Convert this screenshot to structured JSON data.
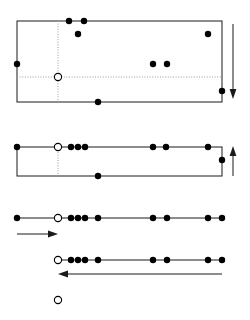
{
  "figure": {
    "title": "",
    "canvas": {
      "width": 250,
      "height": 320,
      "background": "#ffffff"
    },
    "colors": {
      "stroke": "#1a1a1a",
      "guide": "#9a9a9a",
      "marker_filled": "#000000",
      "marker_open_fill": "#ffffff",
      "marker_open_stroke": "#000000"
    },
    "geometry": {
      "left_x": 17,
      "right_x": 222,
      "origin_x": 58,
      "marker_radius_filled": 3.2,
      "marker_radius_open": 3.6,
      "stroke_width": 1
    }
  },
  "panels": [
    {
      "name": "panel-1",
      "type": "rectangle",
      "rect": {
        "x": 17,
        "y": 21,
        "width": 205,
        "height": 81
      },
      "guides": [
        {
          "name": "vertical-guide",
          "orientation": "vertical",
          "x": 58,
          "y1": 21,
          "y2": 102
        },
        {
          "name": "horizontal-guide",
          "orientation": "horizontal",
          "y": 77,
          "x1": 17,
          "x2": 222
        }
      ],
      "origin_marker": {
        "x": 58,
        "y": 77,
        "style": "open"
      },
      "markers": [
        {
          "x": 69,
          "y": 21,
          "style": "filled"
        },
        {
          "x": 84,
          "y": 21,
          "style": "filled"
        },
        {
          "x": 78,
          "y": 34,
          "style": "filled"
        },
        {
          "x": 208,
          "y": 34,
          "style": "filled"
        },
        {
          "x": 17,
          "y": 64,
          "style": "filled"
        },
        {
          "x": 153,
          "y": 64,
          "style": "filled"
        },
        {
          "x": 167,
          "y": 64,
          "style": "filled"
        },
        {
          "x": 222,
          "y": 91,
          "style": "filled"
        },
        {
          "x": 98,
          "y": 102,
          "style": "filled"
        }
      ],
      "arrow": {
        "name": "down-arrow",
        "direction": "down",
        "x": 233,
        "y1": 24,
        "y2": 99
      }
    },
    {
      "name": "panel-2",
      "type": "rectangle",
      "rect": {
        "x": 17,
        "y": 147,
        "width": 205,
        "height": 29
      },
      "guides": [
        {
          "name": "vertical-guide",
          "orientation": "vertical",
          "x": 58,
          "y1": 147,
          "y2": 176
        }
      ],
      "origin_marker": {
        "x": 58,
        "y": 147,
        "style": "open"
      },
      "markers": [
        {
          "x": 17,
          "y": 147,
          "style": "filled"
        },
        {
          "x": 71,
          "y": 147,
          "style": "filled"
        },
        {
          "x": 78,
          "y": 147,
          "style": "filled"
        },
        {
          "x": 85,
          "y": 147,
          "style": "filled"
        },
        {
          "x": 153,
          "y": 147,
          "style": "filled"
        },
        {
          "x": 166,
          "y": 147,
          "style": "filled"
        },
        {
          "x": 208,
          "y": 147,
          "style": "filled"
        },
        {
          "x": 222,
          "y": 160,
          "style": "filled"
        },
        {
          "x": 98,
          "y": 176,
          "style": "filled"
        }
      ],
      "arrow": {
        "name": "up-arrow",
        "direction": "up",
        "x": 233,
        "y1": 176,
        "y2": 146
      }
    },
    {
      "name": "panel-3",
      "type": "axis-line",
      "line": {
        "x1": 17,
        "y": 218,
        "x2": 222
      },
      "origin_marker": {
        "x": 58,
        "y": 218,
        "style": "open"
      },
      "markers": [
        {
          "x": 17,
          "y": 218,
          "style": "filled"
        },
        {
          "x": 71,
          "y": 218,
          "style": "filled"
        },
        {
          "x": 78,
          "y": 218,
          "style": "filled"
        },
        {
          "x": 85,
          "y": 218,
          "style": "filled"
        },
        {
          "x": 98,
          "y": 218,
          "style": "filled"
        },
        {
          "x": 153,
          "y": 218,
          "style": "filled"
        },
        {
          "x": 167,
          "y": 218,
          "style": "filled"
        },
        {
          "x": 208,
          "y": 218,
          "style": "filled"
        },
        {
          "x": 222,
          "y": 218,
          "style": "filled"
        }
      ],
      "arrow": {
        "name": "right-arrow",
        "direction": "right",
        "y": 234,
        "x1": 17,
        "x2": 58
      }
    },
    {
      "name": "panel-4",
      "type": "axis-line",
      "line": {
        "x1": 58,
        "y": 260,
        "x2": 222
      },
      "origin_marker": {
        "x": 58,
        "y": 260,
        "style": "open"
      },
      "markers": [
        {
          "x": 71,
          "y": 260,
          "style": "filled"
        },
        {
          "x": 78,
          "y": 260,
          "style": "filled"
        },
        {
          "x": 85,
          "y": 260,
          "style": "filled"
        },
        {
          "x": 98,
          "y": 260,
          "style": "filled"
        },
        {
          "x": 153,
          "y": 260,
          "style": "filled"
        },
        {
          "x": 167,
          "y": 260,
          "style": "filled"
        },
        {
          "x": 208,
          "y": 260,
          "style": "filled"
        },
        {
          "x": 222,
          "y": 260,
          "style": "filled"
        }
      ],
      "arrow": {
        "name": "left-arrow",
        "direction": "left",
        "y": 274,
        "x1": 222,
        "x2": 58
      }
    },
    {
      "name": "panel-5",
      "type": "marker-only",
      "origin_marker": {
        "x": 58,
        "y": 300,
        "style": "open"
      },
      "markers": []
    }
  ]
}
